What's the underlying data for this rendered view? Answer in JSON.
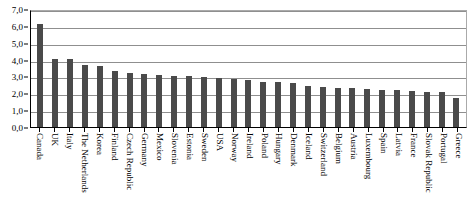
{
  "chart_data": {
    "type": "bar",
    "title": "",
    "xlabel": "",
    "ylabel": "",
    "ylim": [
      0.0,
      7.0
    ],
    "grid": true,
    "legend": null,
    "decimal_separator": ",",
    "bar_color": "#4a4a4a",
    "ytick_labels": [
      "7,0",
      "6,0",
      "5,0",
      "4,0",
      "3,0",
      "2,0",
      "1,0",
      "0,0"
    ],
    "ytick_values": [
      7.0,
      6.0,
      5.0,
      4.0,
      3.0,
      2.0,
      1.0,
      0.0
    ],
    "categories": [
      "Canada",
      "UK",
      "Italy",
      "The Netherlands",
      "Korea",
      "Finland",
      "Czech Republic",
      "Germany",
      "Mexico",
      "Slovenia",
      "Estonia",
      "Sweden",
      "USA",
      "Norway",
      "Ireland",
      "Poland",
      "Hungary",
      "Denmark",
      "Iceland",
      "Switzerland",
      "Belgium",
      "Austria",
      "Luxembourg",
      "Spain",
      "Latvia",
      "France",
      "Slovak Republic",
      "Portugal",
      "Greece"
    ],
    "values": [
      6.1,
      4.05,
      4.05,
      3.65,
      3.6,
      3.35,
      3.2,
      3.15,
      3.1,
      3.05,
      3.0,
      2.95,
      2.9,
      2.85,
      2.8,
      2.7,
      2.65,
      2.6,
      2.45,
      2.4,
      2.3,
      2.3,
      2.25,
      2.2,
      2.2,
      2.15,
      2.1,
      2.05,
      1.75
    ]
  }
}
